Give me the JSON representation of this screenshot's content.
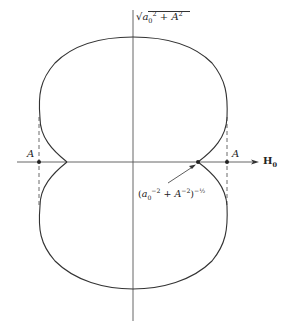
{
  "figure": {
    "type": "polar-like switching curve diagram",
    "labels": {
      "top": "√(a0² + A²)",
      "top_parts": {
        "radicand_a": "a",
        "radicand_sub": "0",
        "sup1": "2",
        "plus": " + ",
        "A": "A",
        "sup2": "2"
      },
      "left_A": "A",
      "right_A": "A",
      "axis": "H",
      "axis_sub": "0",
      "bottom": "(a0⁻² + A⁻²)^(-1/2)",
      "bottom_parts": {
        "open": "(",
        "a": "a",
        "sub": "0",
        "sup1": "−2",
        "plus": " + ",
        "A": "A",
        "sup2": "−2",
        "close": ")",
        "sup3": "−½"
      }
    },
    "colors": {
      "stroke": "#333333",
      "axis": "#555555",
      "background": "#ffffff"
    }
  }
}
